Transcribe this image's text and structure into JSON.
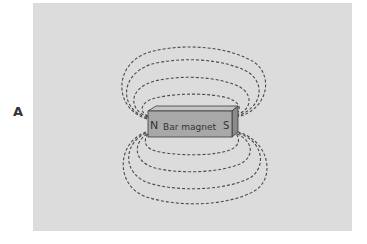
{
  "figure": {
    "panel_label": "A",
    "magnet": {
      "label": "Bar magnet",
      "north_pole": "N",
      "south_pole": "S"
    },
    "field_lines_above": 4,
    "field_lines_below": 4,
    "colors": {
      "background": "#dcdcdc",
      "magnet_front": "#a8a8a8",
      "magnet_top": "#c4c4c4",
      "magnet_side": "#8a8a8a",
      "field_line": "#4a4a4a"
    }
  }
}
